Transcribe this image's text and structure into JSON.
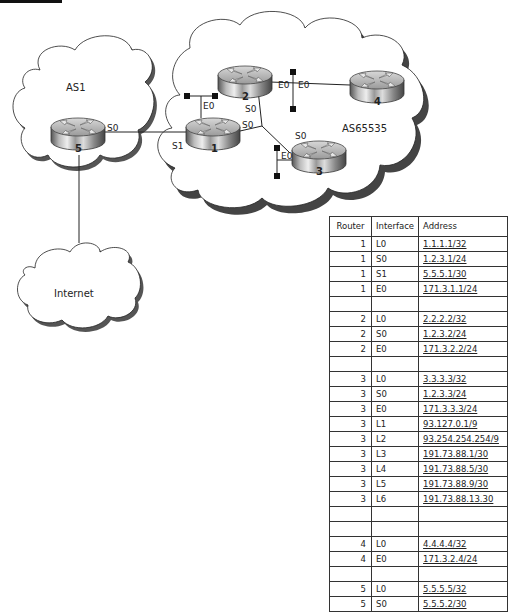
{
  "figure": {
    "clouds": [
      {
        "id": "as1",
        "label": "AS1"
      },
      {
        "id": "as65535",
        "label": "AS65535"
      },
      {
        "id": "internet",
        "label": "Internet"
      }
    ],
    "routers": [
      {
        "id": "r1",
        "number": "1"
      },
      {
        "id": "r2",
        "number": "2"
      },
      {
        "id": "r3",
        "number": "3"
      },
      {
        "id": "r4",
        "number": "4"
      },
      {
        "id": "r5",
        "number": "5"
      }
    ],
    "interface_labels": {
      "r5_s0": "S0",
      "r1_s1": "S1",
      "r1_e0": "E0",
      "r1_s0": "S0",
      "r2_s0": "S0",
      "r2_e0": "E0",
      "r4_e0": "E0",
      "r3_s0": "S0",
      "r3_e0": "E0"
    }
  },
  "table": {
    "headers": [
      "Router",
      "Interface",
      "Address"
    ],
    "rows": [
      {
        "router": "1",
        "interface": "L0",
        "address": "1.1.1.1/32"
      },
      {
        "router": "1",
        "interface": "S0",
        "address": "1.2.3.1/24"
      },
      {
        "router": "1",
        "interface": "S1",
        "address": "5.5.5.1/30"
      },
      {
        "router": "1",
        "interface": "E0",
        "address": "171.3.1.1/24"
      },
      {
        "router": "",
        "interface": "",
        "address": ""
      },
      {
        "router": "2",
        "interface": "L0",
        "address": "2.2.2.2/32"
      },
      {
        "router": "2",
        "interface": "S0",
        "address": "1.2.3.2/24"
      },
      {
        "router": "2",
        "interface": "E0",
        "address": "171.3.2.2/24"
      },
      {
        "router": "",
        "interface": "",
        "address": ""
      },
      {
        "router": "3",
        "interface": "L0",
        "address": "3.3.3.3/32"
      },
      {
        "router": "3",
        "interface": "S0",
        "address": "1.2.3.3/24"
      },
      {
        "router": "3",
        "interface": "E0",
        "address": "171.3.3.3/24"
      },
      {
        "router": "3",
        "interface": "L1",
        "address": "93.127.0.1/9"
      },
      {
        "router": "3",
        "interface": "L2",
        "address": "93.254.254.254/9"
      },
      {
        "router": "3",
        "interface": "L3",
        "address": "191.73.88.1/30"
      },
      {
        "router": "3",
        "interface": "L4",
        "address": "191.73.88.5/30"
      },
      {
        "router": "3",
        "interface": "L5",
        "address": "191.73.88.9/30"
      },
      {
        "router": "3",
        "interface": "L6",
        "address": "191.73.88.13.30"
      },
      {
        "router": "",
        "interface": "",
        "address": ""
      },
      {
        "router": "",
        "interface": "",
        "address": ""
      },
      {
        "router": "4",
        "interface": "L0",
        "address": "4.4.4.4/32"
      },
      {
        "router": "4",
        "interface": "E0",
        "address": "171.3.2.4/24"
      },
      {
        "router": "",
        "interface": "",
        "address": ""
      },
      {
        "router": "5",
        "interface": "L0",
        "address": "5.5.5.5/32"
      },
      {
        "router": "5",
        "interface": "S0",
        "address": "5.5.5.2/30"
      }
    ]
  }
}
